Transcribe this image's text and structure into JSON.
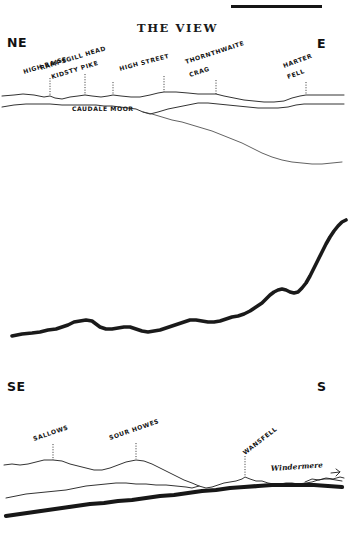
{
  "page": {
    "title": "THE VIEW",
    "background_color": "#ffffff",
    "ink_color": "#1a1a1a",
    "width": 348,
    "height": 550
  },
  "top_rule": {
    "name": "header-rule",
    "x1": 231,
    "x2": 322,
    "y": 5,
    "thickness": 3
  },
  "panels": [
    {
      "id": "panel-ne-e",
      "compass_left": "NE",
      "compass_right": "E",
      "labels": [
        {
          "text": "HIGH RAISE",
          "x": 24,
          "y": 74,
          "rotation": -17,
          "tick_x": 50,
          "tick_y1": 78,
          "tick_y2": 96
        },
        {
          "text": "RAMPSGILL HEAD",
          "x": 41,
          "y": 70,
          "rotation": -17,
          "tick_x": 85,
          "tick_y1": 74,
          "tick_y2": 95
        },
        {
          "text": "KIDSTY PIKE",
          "x": 52,
          "y": 79,
          "rotation": -17,
          "tick_x": 113,
          "tick_y1": 82,
          "tick_y2": 95
        },
        {
          "text": "HIGH STREET",
          "x": 120,
          "y": 71,
          "rotation": -15,
          "tick_x": 164,
          "tick_y1": 76,
          "tick_y2": 92
        },
        {
          "text": "THORNTHWAITE",
          "x": 186,
          "y": 64,
          "rotation": -18,
          "tick_x": 0,
          "tick_y1": 0,
          "tick_y2": 0
        },
        {
          "text": "CRAG",
          "x": 190,
          "y": 77,
          "rotation": -18,
          "tick_x": 216,
          "tick_y1": 80,
          "tick_y2": 94
        },
        {
          "text": "HARTER",
          "x": 284,
          "y": 68,
          "rotation": -20,
          "tick_x": 0,
          "tick_y1": 0,
          "tick_y2": 0
        },
        {
          "text": "FELL",
          "x": 288,
          "y": 79,
          "rotation": -20,
          "tick_x": 306,
          "tick_y1": 82,
          "tick_y2": 95
        },
        {
          "text": "CAUDALE MOOR",
          "x": 72,
          "y": 111,
          "rotation": 0,
          "tick_x": 0,
          "tick_y1": 0,
          "tick_y2": 0
        }
      ]
    },
    {
      "id": "panel-middle-ridge",
      "compass_left": "",
      "compass_right": "",
      "labels": []
    },
    {
      "id": "panel-se-s",
      "compass_left": "SE",
      "compass_right": "S",
      "labels": [
        {
          "text": "SALLOWS",
          "x": 34,
          "y": 441,
          "rotation": -19,
          "tick_x": 53,
          "tick_y1": 444,
          "tick_y2": 460
        },
        {
          "text": "SOUR HOWES",
          "x": 110,
          "y": 440,
          "rotation": -19,
          "tick_x": 136,
          "tick_y1": 443,
          "tick_y2": 459
        },
        {
          "text": "WANSFELL",
          "x": 245,
          "y": 455,
          "rotation": -38,
          "tick_x": 245,
          "tick_y1": 456,
          "tick_y2": 472
        },
        {
          "text": "Windermere",
          "x": 271,
          "y": 471,
          "rotation": -4,
          "tick_x": 0,
          "tick_y1": 0,
          "tick_y2": 0
        }
      ]
    }
  ],
  "chart_data": {
    "type": "line",
    "title": "THE VIEW",
    "xlabel": "",
    "ylabel": "",
    "grid": false,
    "legend_position": "none",
    "series": [
      {
        "name": "ne-e-skyline",
        "panel": "panel-ne-e",
        "stroke": "thin",
        "points": "M2,96 L14,95 L23,94 L34,95 L44,97 L50,96 L55,98 L62,99 L70,97 L78,96 L85,95 L92,96 L101,97 L108,96 L113,95 L121,96 L131,97 L140,97 L150,95 L158,93 L164,92 L176,92 L188,93 L198,94 L206,94 L213,94 L216,94 L224,96 L234,98 L244,100 L254,101 L264,102 L274,102 L284,101 L292,98 L300,96 L306,95 L314,95 L323,95 L334,95 L344,95"
      },
      {
        "name": "ne-e-second-ridge",
        "panel": "panel-ne-e",
        "stroke": "thin",
        "points": "M2,107 L14,105 L26,104 L38,104 L50,104 L62,105 L74,105 L86,105 L96,105 L104,106 L112,106 L120,107 L128,108 L136,109 L143,112 L150,114 L158,112 L168,109 L178,107 L188,105 L198,103 L208,103 L218,104 L228,105 L238,106 L248,107 L258,108 L268,108 L278,108 L288,107 L296,105 L304,104 L314,104 L326,104 L338,104 L344,104"
      },
      {
        "name": "ne-e-foreground-slope",
        "panel": "panel-ne-e",
        "stroke": "faint",
        "points": "M143,112 L152,114 L162,117 L172,120 L182,122 L192,125 L202,128 L212,131 L222,135 L232,139 L242,143 L252,148 L262,153 L272,157 L282,160 L292,162 L302,163 L312,164 L322,164 L332,163 L342,162"
      },
      {
        "name": "middle-ridge",
        "panel": "panel-middle-ridge",
        "stroke": "bold",
        "points": "M12,336 L22,334 L32,333 L40,332 L48,330 L56,329 L62,327 L68,325 L74,322 L80,321 L86,320 L92,321 L96,324 L100,327 L106,329 L112,329 L118,328 L124,327 L130,327 L136,329 L142,331 L148,332 L154,331 L160,330 L166,328 L172,326 L178,324 L184,322 L190,320 L196,320 L202,321 L208,322 L214,322 L220,321 L226,319 L232,317 L238,316 L244,314 L250,311 L256,307 L262,303 L266,299 L270,295 L274,292 L278,290 L282,289 L286,290 L290,292 L294,293 L298,292 L302,288 L306,283 L310,276 L314,268 L318,260 L322,252 L326,244 L330,237 L334,231 L338,226 L342,222 L346,220"
      },
      {
        "name": "se-s-skyline",
        "panel": "panel-se-s",
        "stroke": "thin",
        "points": "M4,465 L12,464 L20,465 L28,464 L36,462 L44,460 L53,460 L62,461 L70,464 L78,466 L86,468 L94,470 L102,470 L110,468 L118,465 L126,462 L136,460 L144,461 L152,464 L160,468 L168,472 L176,476 L184,480 L192,483 L199,486 L206,488 L212,487 L218,485 L224,483 L230,482 L236,481 L242,479 L245,477 L250,479 L256,481 L262,481 L268,483 L274,484 L280,484 L286,483 L292,483 L298,484 L306,483 L312,482 L318,480 L324,479 L330,479 L336,480 L342,481"
      },
      {
        "name": "se-s-mid-ridge",
        "panel": "panel-se-s",
        "stroke": "thin",
        "points": "M6,498 L16,496 L26,494 L36,493 L46,492 L56,491 L66,490 L76,488 L86,486 L96,485 L106,484 L116,483 L126,483 L136,484 L146,484 L156,485 L166,485 L176,486 L186,487 L192,488 L199,486"
      },
      {
        "name": "se-s-foreground-bold",
        "panel": "panel-se-s",
        "stroke": "heavy",
        "points": "M6,516 L20,514 L34,512 L48,510 L62,508 L76,506 L90,504 L104,503 L118,501 L132,500 L146,498 L160,496 L174,495 L188,493 L202,491 L216,490 L230,488 L244,487 L258,486 L272,485 L286,485 L300,485 L314,485 L328,486 L342,487"
      },
      {
        "name": "windermere-water-mark",
        "panel": "panel-se-s",
        "stroke": "thin",
        "points": "M305,482 L312,479 L319,480 L326,478 L333,479 L340,477 L344,478"
      }
    ]
  }
}
